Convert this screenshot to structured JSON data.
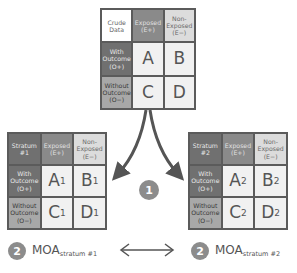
{
  "crude_table": {
    "corner": "Crude Data",
    "col_exposed": "Exposed (E+)",
    "col_nonexposed": "Non-Exposed (E−)",
    "row_with": "With Outcome (O+)",
    "row_without": "Without Outcome (O−)",
    "cells": {
      "a": "A",
      "b": "B",
      "c": "C",
      "d": "D"
    }
  },
  "strata": [
    {
      "corner": "Stratum #1",
      "col_exposed": "Exposed (E+)",
      "col_nonexposed": "Non-Exposed (E−)",
      "row_with": "With Outcome (O+)",
      "row_without": "Without Outcome (O−)",
      "cells": {
        "a": "A",
        "b": "B",
        "c": "C",
        "d": "D"
      },
      "subscript": "1"
    },
    {
      "corner": "Stratum #2",
      "col_exposed": "Exposed (E+)",
      "col_nonexposed": "Non-Exposed (E−)",
      "row_with": "With Outcome (O+)",
      "row_without": "Without Outcome (O−)",
      "cells": {
        "a": "A",
        "b": "B",
        "c": "C",
        "d": "D"
      },
      "subscript": "2"
    }
  ],
  "steps": {
    "step1": "1",
    "step2": "2"
  },
  "moa": [
    {
      "label": "MOA",
      "subscript": "stratum #1"
    },
    {
      "label": "MOA",
      "subscript": "stratum #2"
    }
  ],
  "colors": {
    "border": "#5b5b5b",
    "step_circle": "#8c8c8c",
    "arrow": "#555555"
  }
}
